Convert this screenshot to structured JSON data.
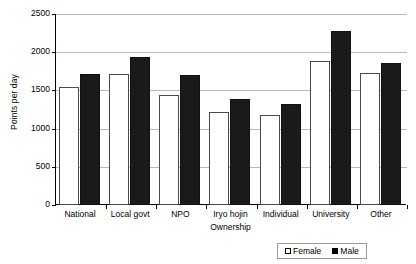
{
  "chart_data": {
    "type": "bar",
    "title": "",
    "xlabel": "Ownership",
    "ylabel": "Points per day",
    "categories": [
      "National",
      "Local govt",
      "NPO",
      "Iryo hojin",
      "Individual",
      "University",
      "Other"
    ],
    "series": [
      {
        "name": "Female",
        "color": "#ffffff",
        "values": [
          1540,
          1720,
          1440,
          1220,
          1180,
          1880,
          1730
        ]
      },
      {
        "name": "Male",
        "color": "#000000",
        "values": [
          1720,
          1940,
          1700,
          1390,
          1320,
          2280,
          1860
        ]
      }
    ],
    "ylim": [
      0,
      2500
    ],
    "y_ticks": [
      0,
      500,
      1000,
      1500,
      2000,
      2500
    ],
    "y_tick_labels": [
      "0",
      "500",
      "1000",
      "1500",
      "2000",
      "2500"
    ],
    "grid": true,
    "legend_position": "bottom-right"
  },
  "axes": {
    "y_title": "Points per day",
    "x_title": "Ownership"
  },
  "legend": {
    "entries": [
      {
        "label": "Female",
        "swatch": "open-square"
      },
      {
        "label": "Male",
        "swatch": "filled-square"
      }
    ]
  }
}
